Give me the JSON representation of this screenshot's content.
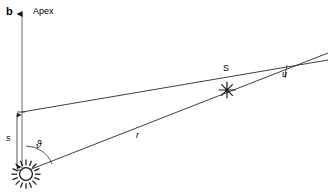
{
  "figure": {
    "panel_letter": "b",
    "background_color": "#ffffff",
    "stroke_color": "#1a1a1a",
    "width": 328,
    "height": 194
  },
  "labels": {
    "apex": "Apex",
    "separation": "s",
    "angle_theta": "ϑ",
    "radius": "r",
    "star": "S",
    "angle_u": "u"
  },
  "markers": {
    "sun": {
      "name": "sun-symbol",
      "x": 26,
      "y": 174,
      "radius": 7,
      "ray_count": 16
    },
    "star": {
      "name": "star-symbol",
      "x": 227,
      "y": 90,
      "points": 8,
      "radius": 8
    }
  },
  "geometry": {
    "apex_axis": {
      "x": 22,
      "y_top": 12,
      "y_bottom": 168
    },
    "horizontal_ray": {
      "x1": 22,
      "y1": 112,
      "x2": 328,
      "y2": 62
    },
    "radius_ray": {
      "x1": 30,
      "y1": 170,
      "x2": 328,
      "y2": 55
    },
    "separation_bracket": {
      "x": 11,
      "y_top": 112,
      "y_bottom": 170
    },
    "theta_arc": {
      "cx": 26,
      "cy": 174,
      "r": 28
    },
    "u_arc": {
      "cx": 227,
      "cy": 90,
      "r": 62
    }
  }
}
